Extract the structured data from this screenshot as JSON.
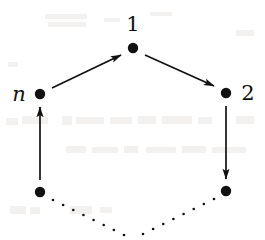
{
  "figure": {
    "type": "directed-cycle-graph",
    "caption": "",
    "ink_color": "#111111",
    "background_color": "#ffffff",
    "artifact_color": "#f2f1ef",
    "vertices": [
      {
        "id": "v1",
        "label": "1",
        "label_style": "upright",
        "x": 133,
        "y": 48,
        "label_x": 133,
        "label_y": 24,
        "label_anchor": "above",
        "radius": 5.2
      },
      {
        "id": "v2",
        "label": "2",
        "label_style": "upright",
        "x": 226,
        "y": 93,
        "label_x": 248,
        "label_y": 93,
        "label_anchor": "right",
        "radius": 5.2
      },
      {
        "id": "vbr",
        "label": "",
        "label_style": "none",
        "x": 226,
        "y": 191,
        "label_x": 226,
        "label_y": 191,
        "label_anchor": "none",
        "radius": 5.2
      },
      {
        "id": "vbl",
        "label": "",
        "label_style": "none",
        "x": 40,
        "y": 192,
        "label_x": 40,
        "label_y": 192,
        "label_anchor": "none",
        "radius": 5.2
      },
      {
        "id": "vn",
        "label": "n",
        "label_style": "math-italic",
        "x": 40,
        "y": 94,
        "label_x": 19,
        "label_y": 94,
        "label_anchor": "left",
        "radius": 5.2
      }
    ],
    "edges": [
      {
        "id": "e-n-1",
        "from": "vn",
        "to": "v1",
        "style": "solid",
        "arrow": true,
        "x1": 52,
        "y1": 88,
        "x2": 121,
        "y2": 55
      },
      {
        "id": "e-1-2",
        "from": "v1",
        "to": "v2",
        "style": "solid",
        "arrow": true,
        "x1": 145,
        "y1": 55,
        "x2": 214,
        "y2": 86
      },
      {
        "id": "e-2-br",
        "from": "v2",
        "to": "vbr",
        "style": "solid",
        "arrow": true,
        "x1": 226,
        "y1": 106,
        "x2": 226,
        "y2": 179
      },
      {
        "id": "e-bl-n",
        "from": "vbl",
        "to": "vn",
        "style": "solid",
        "arrow": true,
        "x1": 40,
        "y1": 180,
        "x2": 40,
        "y2": 107
      },
      {
        "id": "e-br-dots",
        "from": "vbr",
        "to": "bottom",
        "style": "dotted",
        "arrow": false,
        "x1": 214,
        "y1": 199,
        "x2": 143,
        "y2": 234,
        "dot_count": 8
      },
      {
        "id": "e-bl-dots",
        "from": "vbl",
        "to": "bottom",
        "style": "dotted",
        "arrow": false,
        "x1": 53,
        "y1": 200,
        "x2": 124,
        "y2": 235,
        "dot_count": 8
      }
    ],
    "label_font_size_px": 21,
    "arrow_stroke_width": 1.7,
    "arrow_head_length": 11,
    "arrow_head_width": 6,
    "dot_radius": 1.3,
    "background_artifacts": [
      {
        "x": 45,
        "y": 14,
        "w": 42,
        "h": 5
      },
      {
        "x": 48,
        "y": 22,
        "w": 38,
        "h": 5
      },
      {
        "x": 104,
        "y": 18,
        "w": 16,
        "h": 4
      },
      {
        "x": 150,
        "y": 12,
        "w": 22,
        "h": 4
      },
      {
        "x": 6,
        "y": 118,
        "w": 12,
        "h": 7
      },
      {
        "x": 22,
        "y": 116,
        "w": 26,
        "h": 8
      },
      {
        "x": 62,
        "y": 116,
        "w": 10,
        "h": 9
      },
      {
        "x": 76,
        "y": 117,
        "w": 28,
        "h": 7
      },
      {
        "x": 110,
        "y": 117,
        "w": 22,
        "h": 7
      },
      {
        "x": 138,
        "y": 116,
        "w": 18,
        "h": 8
      },
      {
        "x": 162,
        "y": 116,
        "w": 30,
        "h": 8
      },
      {
        "x": 198,
        "y": 117,
        "w": 14,
        "h": 7
      },
      {
        "x": 236,
        "y": 116,
        "w": 18,
        "h": 8
      },
      {
        "x": 66,
        "y": 146,
        "w": 20,
        "h": 7
      },
      {
        "x": 92,
        "y": 147,
        "w": 26,
        "h": 6
      },
      {
        "x": 124,
        "y": 146,
        "w": 14,
        "h": 7
      },
      {
        "x": 146,
        "y": 147,
        "w": 30,
        "h": 6
      },
      {
        "x": 182,
        "y": 146,
        "w": 24,
        "h": 7
      },
      {
        "x": 212,
        "y": 147,
        "w": 34,
        "h": 6
      },
      {
        "x": 10,
        "y": 206,
        "w": 16,
        "h": 8
      },
      {
        "x": 30,
        "y": 207,
        "w": 10,
        "h": 7
      },
      {
        "x": 70,
        "y": 206,
        "w": 22,
        "h": 8
      },
      {
        "x": 100,
        "y": 207,
        "w": 12,
        "h": 6
      },
      {
        "x": 236,
        "y": 30,
        "w": 18,
        "h": 6
      },
      {
        "x": 8,
        "y": 62,
        "w": 10,
        "h": 5
      }
    ]
  }
}
